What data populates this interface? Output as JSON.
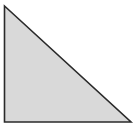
{
  "diagram": {
    "shape": "right-triangle",
    "vertices": [
      {
        "x": 4.5,
        "y": 6
      },
      {
        "x": 4.5,
        "y": 122
      },
      {
        "x": 131,
        "y": 122
      }
    ],
    "fill_color": "#d9d9d9",
    "stroke_color": "#2a2a2a",
    "stroke_width": 1.6,
    "background_color": "#ffffff"
  }
}
